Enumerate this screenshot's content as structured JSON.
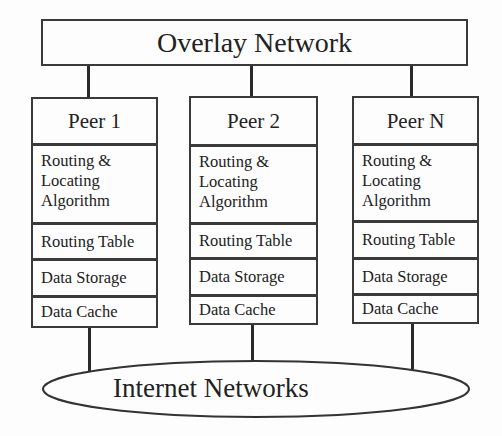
{
  "diagram": {
    "overlay": {
      "label": "Overlay Network"
    },
    "peers": [
      {
        "title": "Peer 1",
        "layers": [
          {
            "lines": [
              "Routing &",
              "Locating",
              "Algorithm"
            ]
          },
          {
            "label": "Routing Table"
          },
          {
            "label": "Data Storage"
          },
          {
            "label": "Data Cache"
          }
        ]
      },
      {
        "title": "Peer 2",
        "layers": [
          {
            "lines": [
              "Routing &",
              "Locating",
              "Algorithm"
            ]
          },
          {
            "label": "Routing Table"
          },
          {
            "label": "Data Storage"
          },
          {
            "label": "Data Cache"
          }
        ]
      },
      {
        "title": "Peer N",
        "layers": [
          {
            "lines": [
              "Routing &",
              "Locating",
              "Algorithm"
            ]
          },
          {
            "label": "Routing Table"
          },
          {
            "label": "Data Storage"
          },
          {
            "label": "Data Cache"
          }
        ]
      }
    ],
    "internet": {
      "label": "Internet Networks"
    },
    "colors": {
      "line": "#2a2a2a",
      "background": "#fdfdfd",
      "text": "#222222"
    }
  }
}
